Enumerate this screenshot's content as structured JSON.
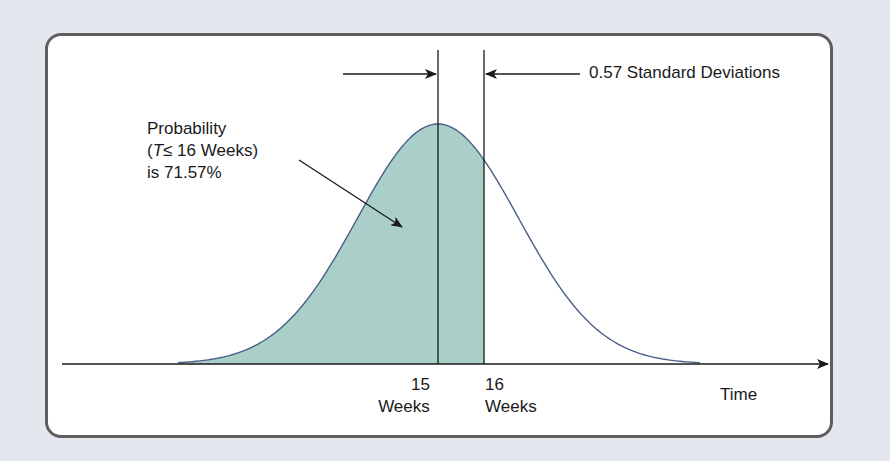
{
  "chart_data": {
    "type": "area",
    "title": "",
    "xlabel": "Time",
    "ylabel": "",
    "distribution": "normal",
    "mean_weeks": 15,
    "target_weeks": 16,
    "z_score": 0.57,
    "shaded_region": "T <= 16 weeks",
    "probability_percent": 71.57,
    "x_ticks": [
      {
        "value": 15,
        "label_line1": "15",
        "label_line2": "Weeks"
      },
      {
        "value": 16,
        "label_line1": "16",
        "label_line2": "Weeks"
      }
    ],
    "annotations": [
      {
        "text": "0.57 Standard Deviations",
        "type": "dimension-arrows",
        "between": [
          15,
          16
        ]
      },
      {
        "text": "Probability (T ≤ 16 Weeks) is 71.57%",
        "type": "callout-arrow",
        "target": "shaded-area"
      }
    ],
    "grid": false,
    "legend": "none",
    "colors": {
      "fill": "#a9cfc8",
      "curve": "#4a5f87",
      "axis": "#1a1a1a",
      "frame": "#5e5e5e",
      "background": "#e4e8ee"
    }
  },
  "labels": {
    "prob_line1": "Probability",
    "prob_line2_open": "(",
    "prob_line2_var": "T",
    "prob_line2_rest": "≤  16 Weeks)",
    "prob_line3": "is 71.57%",
    "sd": "0.57 Standard Deviations",
    "tick15_num": "15",
    "tick15_unit": "Weeks",
    "tick16_num": "16",
    "tick16_unit": "Weeks",
    "xlabel": "Time"
  }
}
